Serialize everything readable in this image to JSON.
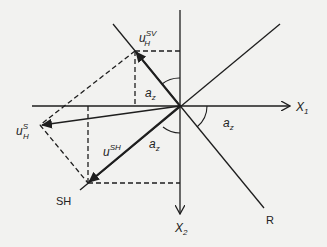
{
  "diagram": {
    "axes": {
      "x1_label": "X",
      "x1_sub": "1",
      "x2_label": "X",
      "x2_sub": "2"
    },
    "lines": {
      "sh_label": "SH",
      "r_label": "R"
    },
    "vectors": {
      "u_sv": {
        "base": "u",
        "sup": "SV",
        "sub": "H"
      },
      "u_s": {
        "base": "u",
        "sup": "S",
        "sub": "H"
      },
      "u_sh": {
        "base": "u",
        "sup": "SH"
      }
    },
    "angles": {
      "label_base": "a",
      "label_sub": "z"
    },
    "colors": {
      "line": "#1e1e1e",
      "background": "#f2f2f0"
    }
  }
}
